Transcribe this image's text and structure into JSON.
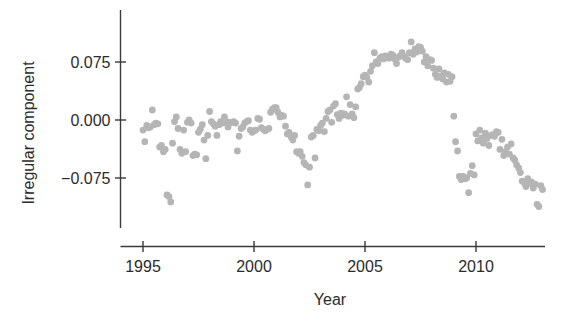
{
  "chart_data": {
    "type": "scatter",
    "title": "",
    "xlabel": "Year",
    "ylabel": "Irregular component",
    "xlim": [
      1994.6,
      2013.3
    ],
    "ylim": [
      -0.118,
      0.112
    ],
    "grid": false,
    "legend": null,
    "point_color": "#b5b5b5",
    "point_radius": 3.4,
    "axis_color": "#3a3a3a",
    "xticks": [
      1995,
      2000,
      2005,
      2010
    ],
    "xtick_labels": [
      "1995",
      "2000",
      "2005",
      "2010"
    ],
    "yticks": [
      0.075,
      0.0,
      -0.075
    ],
    "ytick_labels": [
      "0.075",
      "0.000",
      "−0.075"
    ],
    "series": [
      {
        "name": "Irregular component",
        "x": [
          1995.0,
          1995.08,
          1995.17,
          1995.25,
          1995.33,
          1995.42,
          1995.5,
          1995.58,
          1995.67,
          1995.75,
          1995.83,
          1995.92,
          1996.0,
          1996.08,
          1996.17,
          1996.25,
          1996.33,
          1996.42,
          1996.5,
          1996.58,
          1996.67,
          1996.75,
          1996.83,
          1996.92,
          1997.0,
          1997.08,
          1997.17,
          1997.25,
          1997.33,
          1997.42,
          1997.5,
          1997.58,
          1997.67,
          1997.75,
          1997.83,
          1997.92,
          1998.0,
          1998.08,
          1998.17,
          1998.25,
          1998.33,
          1998.42,
          1998.5,
          1998.58,
          1998.67,
          1998.75,
          1998.83,
          1998.92,
          1999.0,
          1999.08,
          1999.17,
          1999.25,
          1999.33,
          1999.42,
          1999.5,
          1999.58,
          1999.67,
          1999.75,
          1999.83,
          1999.92,
          2000.0,
          2000.08,
          2000.17,
          2000.25,
          2000.33,
          2000.42,
          2000.5,
          2000.58,
          2000.67,
          2000.75,
          2000.83,
          2000.92,
          2001.0,
          2001.08,
          2001.17,
          2001.25,
          2001.33,
          2001.42,
          2001.5,
          2001.58,
          2001.67,
          2001.75,
          2001.83,
          2001.92,
          2002.0,
          2002.08,
          2002.17,
          2002.25,
          2002.33,
          2002.42,
          2002.5,
          2002.58,
          2002.67,
          2002.75,
          2002.83,
          2002.92,
          2003.0,
          2003.08,
          2003.17,
          2003.25,
          2003.33,
          2003.42,
          2003.5,
          2003.58,
          2003.67,
          2003.75,
          2003.83,
          2003.92,
          2004.0,
          2004.08,
          2004.17,
          2004.25,
          2004.33,
          2004.42,
          2004.5,
          2004.58,
          2004.67,
          2004.75,
          2004.83,
          2004.92,
          2005.0,
          2005.08,
          2005.17,
          2005.25,
          2005.33,
          2005.42,
          2005.5,
          2005.58,
          2005.67,
          2005.75,
          2005.83,
          2005.92,
          2006.0,
          2006.08,
          2006.17,
          2006.25,
          2006.33,
          2006.42,
          2006.5,
          2006.58,
          2006.67,
          2006.75,
          2006.83,
          2006.92,
          2007.0,
          2007.08,
          2007.17,
          2007.25,
          2007.33,
          2007.42,
          2007.5,
          2007.58,
          2007.67,
          2007.75,
          2007.83,
          2007.92,
          2008.0,
          2008.08,
          2008.17,
          2008.25,
          2008.33,
          2008.42,
          2008.5,
          2008.58,
          2008.67,
          2008.75,
          2008.83,
          2008.92,
          2009.0,
          2009.08,
          2009.17,
          2009.25,
          2009.33,
          2009.42,
          2009.5,
          2009.58,
          2009.67,
          2009.75,
          2009.83,
          2009.92,
          2010.0,
          2010.08,
          2010.17,
          2010.25,
          2010.33,
          2010.42,
          2010.5,
          2010.58,
          2010.67,
          2010.75,
          2010.83,
          2010.92,
          2011.0,
          2011.08,
          2011.17,
          2011.25,
          2011.33,
          2011.42,
          2011.5,
          2011.58,
          2011.67,
          2011.75,
          2011.83,
          2011.92,
          2012.0,
          2012.08,
          2012.17,
          2012.25,
          2012.33,
          2012.42,
          2012.5,
          2012.58,
          2012.67,
          2012.75,
          2012.83,
          2012.92,
          2013.0
        ],
        "y": [
          -0.013,
          -0.028,
          -0.007,
          -0.01,
          -0.009,
          0.013,
          -0.006,
          -0.004,
          -0.005,
          -0.035,
          -0.033,
          -0.041,
          -0.038,
          -0.097,
          -0.099,
          -0.106,
          -0.03,
          -0.002,
          0.004,
          -0.011,
          -0.038,
          -0.043,
          -0.013,
          -0.041,
          -0.003,
          0.0,
          -0.004,
          -0.046,
          -0.044,
          -0.045,
          -0.016,
          -0.012,
          -0.006,
          -0.026,
          -0.05,
          -0.02,
          0.011,
          -0.002,
          -0.005,
          -0.008,
          -0.02,
          -0.006,
          -0.002,
          -0.004,
          0.004,
          -0.002,
          -0.009,
          -0.003,
          -0.003,
          -0.002,
          -0.004,
          -0.04,
          -0.021,
          -0.011,
          -0.009,
          -0.004,
          -0.002,
          -0.001,
          -0.013,
          -0.016,
          -0.014,
          -0.013,
          0.002,
          0.001,
          -0.01,
          -0.012,
          -0.014,
          -0.012,
          -0.011,
          0.01,
          0.014,
          0.016,
          0.016,
          0.01,
          0.004,
          0.006,
          0.005,
          -0.008,
          -0.018,
          -0.016,
          -0.022,
          -0.026,
          -0.02,
          -0.041,
          -0.043,
          -0.041,
          -0.047,
          -0.055,
          -0.058,
          -0.084,
          -0.061,
          -0.022,
          -0.02,
          -0.049,
          -0.012,
          -0.014,
          -0.007,
          -0.004,
          -0.015,
          0.002,
          0.011,
          0.013,
          -0.003,
          0.018,
          0.021,
          0.007,
          0.002,
          0.009,
          0.006,
          0.008,
          0.03,
          0.005,
          0.02,
          0.008,
          0.003,
          0.017,
          0.04,
          0.042,
          0.047,
          0.056,
          0.058,
          0.055,
          0.049,
          0.063,
          0.07,
          0.087,
          0.075,
          0.073,
          0.08,
          0.082,
          0.079,
          0.083,
          0.082,
          0.08,
          0.085,
          0.084,
          0.079,
          0.073,
          0.081,
          0.083,
          0.087,
          0.082,
          0.08,
          0.078,
          0.087,
          0.101,
          0.085,
          0.092,
          0.088,
          0.095,
          0.094,
          0.089,
          0.075,
          0.082,
          0.07,
          0.078,
          0.077,
          0.067,
          0.059,
          0.055,
          0.066,
          0.057,
          0.053,
          0.061,
          0.049,
          0.059,
          0.05,
          0.056,
          0.005,
          -0.028,
          -0.04,
          -0.073,
          -0.077,
          -0.073,
          -0.076,
          -0.075,
          -0.094,
          -0.069,
          -0.059,
          -0.071,
          -0.018,
          -0.027,
          -0.013,
          -0.023,
          -0.03,
          -0.017,
          -0.024,
          -0.033,
          -0.02,
          -0.019,
          -0.021,
          -0.015,
          -0.016,
          -0.038,
          -0.025,
          -0.046,
          -0.041,
          -0.035,
          -0.044,
          -0.031,
          -0.049,
          -0.052,
          -0.058,
          -0.062,
          -0.068,
          -0.079,
          -0.081,
          -0.086,
          -0.076,
          -0.082,
          -0.08,
          -0.088,
          -0.083,
          -0.109,
          -0.112,
          -0.085,
          -0.09
        ]
      }
    ]
  },
  "axes": {
    "x_title": "Year",
    "y_title": "Irregular component"
  }
}
